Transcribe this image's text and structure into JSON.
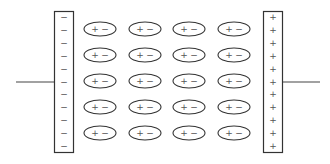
{
  "diagram": {
    "type": "capacitor-with-polarized-dielectric",
    "left_plate": {
      "charge_symbol": "−",
      "charge_count": 11
    },
    "right_plate": {
      "charge_symbol": "+",
      "charge_count": 11
    },
    "dielectric": {
      "rows": 5,
      "cols": 4,
      "molecule_label_positive": "+",
      "molecule_label_negative": "−"
    },
    "colors": {
      "stroke": "#333333",
      "text": "#555555",
      "background": "#ffffff"
    }
  }
}
